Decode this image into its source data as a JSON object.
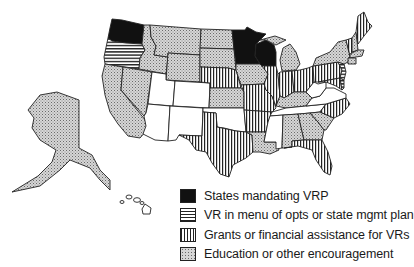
{
  "map": {
    "title": "US states voluntary remediation program policies",
    "categories": {
      "mandating": {
        "label": "States mandating VRP",
        "pattern": "solid-black",
        "color": "#111111"
      },
      "menu": {
        "label": "VR in menu of opts or state mgmt plan",
        "pattern": "horizontal-stripes",
        "color": "#222222"
      },
      "grants": {
        "label": "Grants or financial assistance for VRs",
        "pattern": "vertical-stripes",
        "color": "#222222"
      },
      "education": {
        "label": "Education or other encouragement",
        "pattern": "stipple",
        "color": "#c8c8c8"
      },
      "none": {
        "label": "",
        "pattern": "white",
        "color": "#ffffff"
      }
    },
    "states": {
      "WA": "mandating",
      "MN": "mandating",
      "WI": "mandating",
      "OR": "menu",
      "NJ": "menu",
      "DE": "menu",
      "NE": "grants",
      "MO": "grants",
      "IL": "grants",
      "TX": "grants",
      "AR": "grants",
      "IN": "grants",
      "OH": "grants",
      "PA": "grants",
      "ME": "grants",
      "NC": "grants",
      "FL": "grants",
      "MD": "grants",
      "VT": "grants",
      "ID": "education",
      "MT": "education",
      "ND": "education",
      "SD": "education",
      "WY": "education",
      "CA": "education",
      "NV": "education",
      "KS": "education",
      "IA": "education",
      "MI": "education",
      "LA": "education",
      "KY": "education",
      "NY": "education",
      "MS": "none",
      "AL": "education",
      "GA": "education",
      "SC": "education",
      "NH": "education",
      "MA": "education",
      "CT": "education",
      "AK": "education",
      "HI": "none",
      "UT": "none",
      "CO": "none",
      "AZ": "none",
      "NM": "none",
      "OK": "none",
      "TN": "none",
      "WV": "none",
      "VA": "none"
    }
  },
  "legend": {
    "items": [
      {
        "label": "States mandating VRP"
      },
      {
        "label": "VR in menu of opts or state mgmt plan"
      },
      {
        "label": "Grants or financial assistance for VRs"
      },
      {
        "label": "Education or other encouragement"
      }
    ]
  }
}
